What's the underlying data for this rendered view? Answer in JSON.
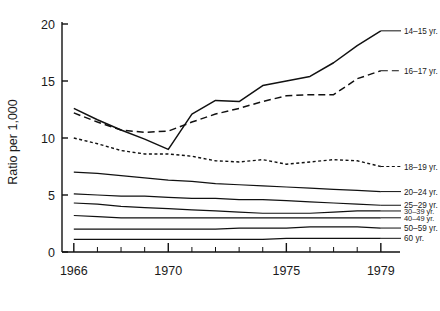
{
  "chart_data": {
    "type": "line",
    "title": "",
    "xlabel": "",
    "ylabel": "Ratio per 1,000",
    "x": [
      1966,
      1967,
      1968,
      1969,
      1970,
      1971,
      1972,
      1973,
      1974,
      1975,
      1976,
      1977,
      1978,
      1979
    ],
    "xtick_labels_major": [
      "1966",
      "1970",
      "1975",
      "1979"
    ],
    "xtick_values_major": [
      1966,
      1970,
      1975,
      1979
    ],
    "xlim": [
      1965.5,
      1979.6
    ],
    "ylim": [
      0,
      20
    ],
    "ytick_labels": [
      "0",
      "5",
      "10",
      "15",
      "20"
    ],
    "ytick_values": [
      0,
      5,
      10,
      15,
      20
    ],
    "grid": false,
    "legend_position": "right-of-axes (direct line labels)",
    "series": [
      {
        "name": "14-15 yr.",
        "label": "14–15 yr.",
        "style": "solid",
        "dash": "none",
        "width": 1.5,
        "label_y_value": 19.4,
        "values": [
          12.6,
          11.6,
          10.7,
          9.9,
          9.0,
          12.1,
          13.3,
          13.2,
          14.6,
          15.0,
          15.4,
          16.6,
          18.1,
          19.4
        ]
      },
      {
        "name": "16-17 yr.",
        "label": "16–17 yr.",
        "style": "dashed",
        "dash": "7,4",
        "width": 1.5,
        "label_y_value": 15.9,
        "values": [
          12.2,
          11.4,
          10.7,
          10.5,
          10.6,
          11.4,
          12.1,
          12.6,
          13.2,
          13.7,
          13.8,
          13.8,
          15.2,
          15.9
        ]
      },
      {
        "name": "18-19 yr.",
        "label": "18–19 yr.",
        "style": "dotted",
        "dash": "3,2.5",
        "width": 1.4,
        "label_y_value": 7.5,
        "values": [
          10.0,
          9.5,
          8.9,
          8.6,
          8.6,
          8.4,
          8.0,
          7.9,
          8.1,
          7.7,
          7.9,
          8.1,
          8.0,
          7.5
        ]
      },
      {
        "name": "20-24 yr.",
        "label": "20–24 yr.",
        "style": "solid",
        "dash": "none",
        "width": 1.2,
        "label_y_value": 5.3,
        "values": [
          7.0,
          6.9,
          6.7,
          6.5,
          6.3,
          6.2,
          6.0,
          5.9,
          5.8,
          5.7,
          5.6,
          5.5,
          5.4,
          5.3
        ]
      },
      {
        "name": "25-29 yr.",
        "label": "25–29 yr.",
        "style": "solid",
        "dash": "none",
        "width": 1.2,
        "label_y_value": 4.1,
        "values": [
          5.1,
          5.0,
          4.9,
          4.9,
          4.8,
          4.7,
          4.7,
          4.6,
          4.6,
          4.5,
          4.4,
          4.3,
          4.2,
          4.1
        ]
      },
      {
        "name": "30-39 yr.",
        "label": "30–39 yr.",
        "style": "solid",
        "dash": "none",
        "width": 1.2,
        "label_y_value": 3.6,
        "values": [
          4.3,
          4.2,
          4.0,
          3.9,
          3.8,
          3.7,
          3.6,
          3.5,
          3.4,
          3.4,
          3.4,
          3.5,
          3.6,
          3.6
        ]
      },
      {
        "name": "40-49 yr.",
        "label": "40–49 yr.",
        "style": "solid",
        "dash": "none",
        "width": 1.2,
        "label_y_value": 3.0,
        "values": [
          3.2,
          3.1,
          3.0,
          3.0,
          3.0,
          3.0,
          3.0,
          3.0,
          3.0,
          3.0,
          3.0,
          3.0,
          3.0,
          3.0
        ]
      },
      {
        "name": "50-59 yr.",
        "label": "50–59 yr.",
        "style": "solid",
        "dash": "none",
        "width": 1.2,
        "label_y_value": 2.1,
        "values": [
          2.0,
          2.0,
          2.0,
          2.0,
          2.0,
          2.0,
          2.0,
          2.1,
          2.1,
          2.1,
          2.2,
          2.2,
          2.2,
          2.1
        ]
      },
      {
        "name": "60 yr.",
        "label": "60 yr.",
        "style": "solid",
        "dash": "none",
        "width": 1.2,
        "label_y_value": 1.2,
        "values": [
          1.1,
          1.1,
          1.1,
          1.1,
          1.1,
          1.1,
          1.1,
          1.1,
          1.1,
          1.2,
          1.2,
          1.2,
          1.2,
          1.2
        ]
      }
    ]
  }
}
